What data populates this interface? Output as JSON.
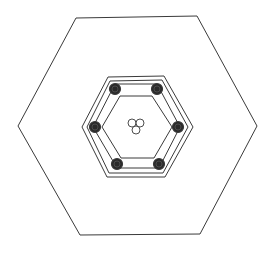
{
  "diagram": {
    "type": "hexagonal-cross-section-line-drawing",
    "width": 274,
    "height": 253,
    "stroke_color": "#3a3a3a",
    "fill_color": "#ffffff",
    "bar_fill_color": "#2a2a2a",
    "outer_hexagon": {
      "points": [
        [
          76,
          18
        ],
        [
          197,
          16
        ],
        [
          257,
          126
        ],
        [
          200,
          234
        ],
        [
          80,
          235
        ],
        [
          18,
          126
        ]
      ],
      "stroke_width": 1
    },
    "shell_hexagons": [
      {
        "name": "shell-outer-line",
        "points": [
          [
            108,
            77
          ],
          [
            164,
            76
          ],
          [
            193,
            127
          ],
          [
            165,
            177
          ],
          [
            107,
            177
          ],
          [
            82,
            127
          ]
        ],
        "stroke_width": 1
      },
      {
        "name": "shell-inner-line",
        "points": [
          [
            110,
            81
          ],
          [
            162,
            80
          ],
          [
            188,
            127
          ],
          [
            163,
            173
          ],
          [
            109,
            173
          ],
          [
            87,
            127
          ]
        ],
        "stroke_width": 1
      }
    ],
    "cage_hexagons": [
      {
        "name": "cage-outer-line",
        "points": [
          [
            115,
            84
          ],
          [
            157,
            84
          ],
          [
            180,
            127
          ],
          [
            159,
            168
          ],
          [
            117,
            168
          ],
          [
            93,
            127
          ]
        ],
        "stroke_width": 1
      },
      {
        "name": "cage-inner-line",
        "points": [
          [
            120,
            96
          ],
          [
            152,
            96
          ],
          [
            172,
            127
          ],
          [
            154,
            158
          ],
          [
            121,
            158
          ],
          [
            102,
            127
          ]
        ],
        "stroke_width": 1
      }
    ],
    "rebars": [
      {
        "cx": 115,
        "cy": 89,
        "r": 5.5
      },
      {
        "cx": 157,
        "cy": 89,
        "r": 5.5
      },
      {
        "cx": 178,
        "cy": 127,
        "r": 5.5
      },
      {
        "cx": 159,
        "cy": 164,
        "r": 5.5
      },
      {
        "cx": 117,
        "cy": 164,
        "r": 5.5
      },
      {
        "cx": 95,
        "cy": 127,
        "r": 5.5
      }
    ],
    "center_ducts": [
      {
        "cx": 132,
        "cy": 123,
        "r": 4
      },
      {
        "cx": 140,
        "cy": 123,
        "r": 4
      },
      {
        "cx": 136,
        "cy": 130,
        "r": 4
      }
    ]
  }
}
